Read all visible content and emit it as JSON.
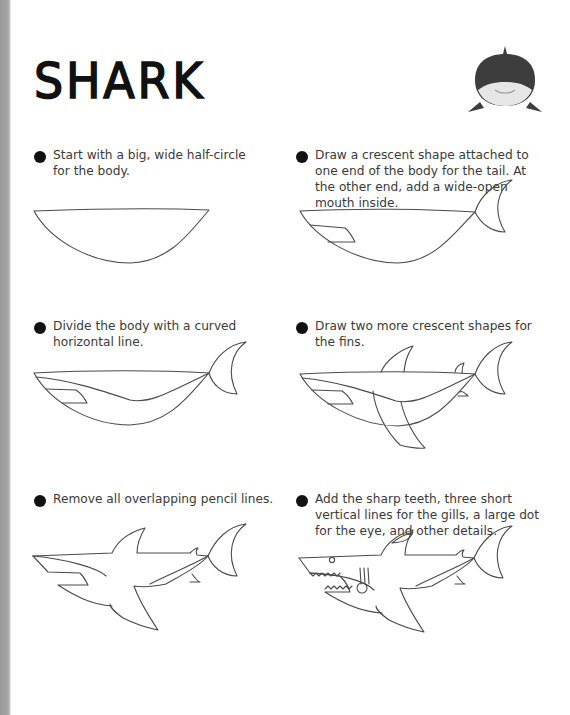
{
  "page": {
    "title": "SHARK",
    "badge_icon": "shark-face-icon",
    "colors": {
      "ink": "#111111",
      "text": "#3a3a3a",
      "line": "#4a4a4a",
      "spine": "#a0a0a0",
      "shark_dark": "#3d3d3d",
      "shark_light": "#e6e6e6"
    }
  },
  "steps": [
    {
      "number": "1",
      "text": "Start with a big, wide half-circle for the body."
    },
    {
      "number": "2",
      "text": "Draw a crescent shape attached to one end of the body for the tail. At the other end, add a wide-open mouth inside."
    },
    {
      "number": "3",
      "text": "Divide the body with a curved horizontal line."
    },
    {
      "number": "4",
      "text": "Draw two more crescent shapes for the fins."
    },
    {
      "number": "5",
      "text": "Remove all overlapping pencil lines."
    },
    {
      "number": "6",
      "text": "Add the sharp teeth, three short vertical lines for the gills, a large dot for the eye, and other details."
    }
  ]
}
